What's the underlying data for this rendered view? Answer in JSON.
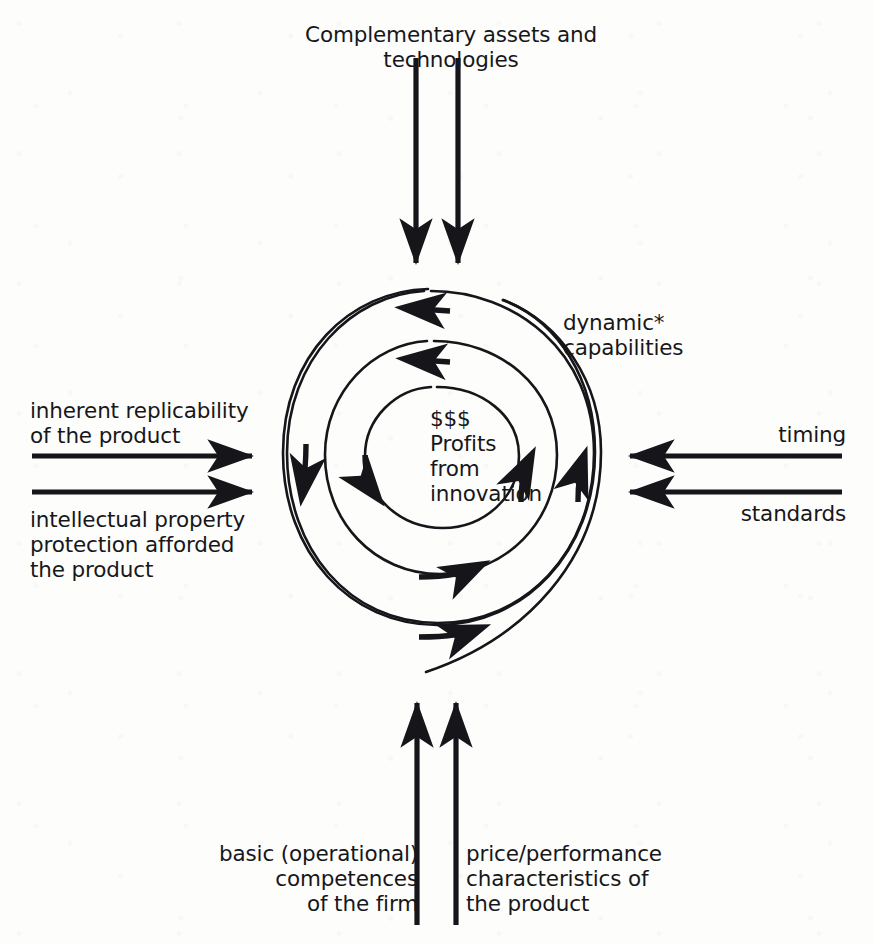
{
  "diagram": {
    "stroke_color": "#15151a",
    "background_color": "#fdfdfc",
    "labels": {
      "top": "Complementary assets and technologies",
      "left_upper": "inherent replicability\nof the product",
      "left_lower": "intellectual property\nprotection afforded\nthe product",
      "right_upper": "timing",
      "right_lower": "standards",
      "spiral_annotation": "dynamic*\ncapabilities",
      "center": "$$$\nProfits\nfrom\ninnovation",
      "bottom_left": "basic (operational)\ncompetences\nof the firm",
      "bottom_right": "price/performance\ncharacteristics of\nthe product"
    },
    "arrows": {
      "top_inward_count": 2,
      "left_inward_count": 2,
      "right_inward_count": 2,
      "bottom_inward_count": 2,
      "spiral_flow_count": 7
    }
  }
}
